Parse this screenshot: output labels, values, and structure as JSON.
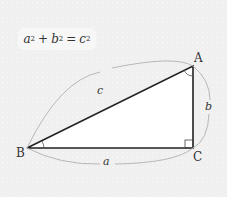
{
  "formula": {
    "a": "a",
    "b": "b",
    "c": "c",
    "exp": "2",
    "plus": "+",
    "eq": "="
  },
  "vertices": {
    "A": "A",
    "B": "B",
    "C": "C"
  },
  "sides": {
    "a": "a",
    "b": "b",
    "c": "c"
  },
  "colors": {
    "triangle": "#222222",
    "arc": "#aaaaaa",
    "fill": "#ffffff"
  }
}
